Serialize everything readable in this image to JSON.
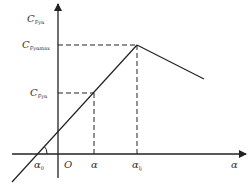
{
  "diagram": {
    "y_axis_label": {
      "main": "C",
      "sub": "Fyα"
    },
    "y_max_label": {
      "main": "C",
      "sub": "Fyαmax"
    },
    "y_alpha_label": {
      "main": "C",
      "sub": "Fyα"
    },
    "origin_label": "O",
    "alpha0_label": {
      "main": "α",
      "sub": "0"
    },
    "alpha_label": "α",
    "alpha_lj_label": {
      "main": "α",
      "sub": "lj"
    },
    "x_axis_label": "α",
    "colors": {
      "line": "#222222",
      "text": "#333333"
    },
    "points": {
      "origin": [
        58,
        154
      ],
      "alpha0": [
        37,
        154
      ],
      "alpha": [
        94,
        93
      ],
      "peak": [
        137,
        45
      ],
      "tail_end": [
        204,
        79
      ]
    }
  }
}
